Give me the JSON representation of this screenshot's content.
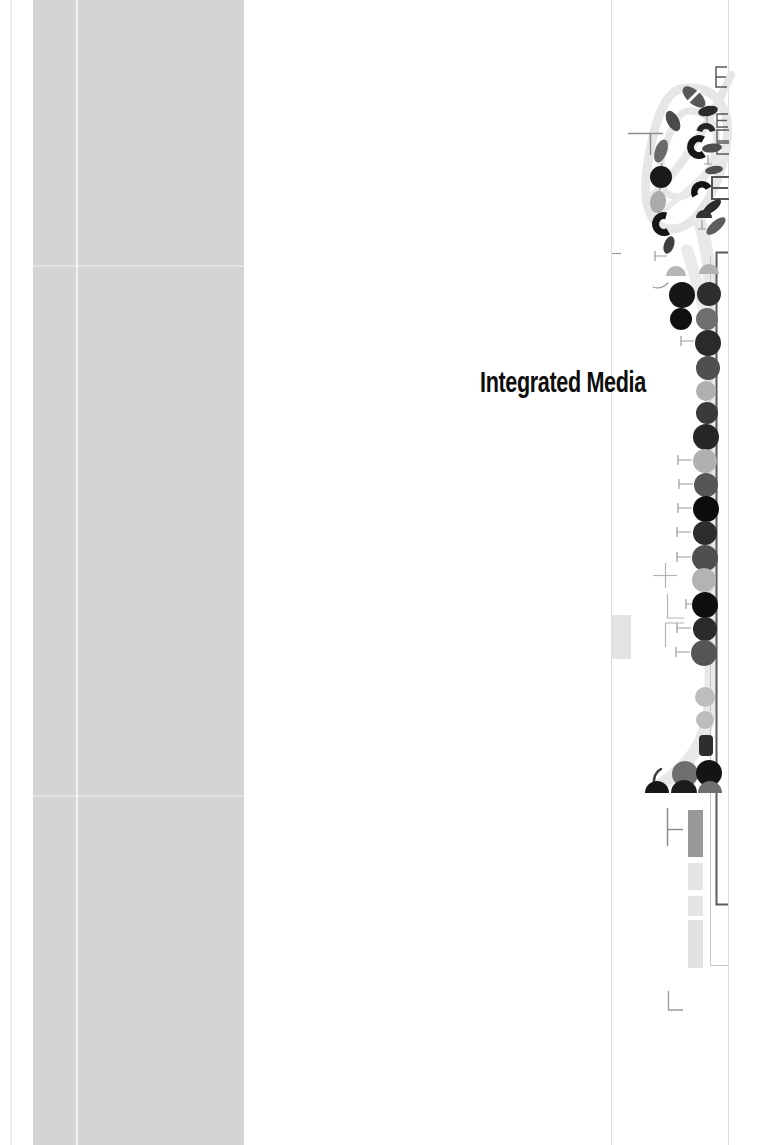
{
  "page": {
    "width": 781,
    "height": 1145,
    "background": "#ffffff",
    "title": "Integrated Media",
    "title_color": "#0e0e0e"
  },
  "artwork": {
    "palette": {
      "band_gray": "#d4d4d4",
      "swirl_gray": "#e6e6e6",
      "rule_gray": "#dedede",
      "bracket_dark": "#5b5b5b",
      "ink_black": "#141414"
    },
    "elements": [
      {
        "t": "rect",
        "name": "page-edge-line",
        "x": 10,
        "y": 0,
        "w": 2,
        "h": 1145,
        "fill": "#ededed"
      },
      {
        "t": "rect",
        "name": "left-gray-band",
        "x": 33,
        "y": 0,
        "w": 211,
        "h": 1145,
        "fill": "#d4d4d4"
      },
      {
        "t": "rect",
        "name": "band-white-line",
        "x": 76,
        "y": 0,
        "w": 2,
        "h": 1145,
        "fill": "#ffffff",
        "op": 0.7
      },
      {
        "t": "rect",
        "name": "band-artifact-line",
        "x": 33,
        "y": 265,
        "w": 211,
        "h": 2,
        "fill": "#ffffff",
        "op": 0.35
      },
      {
        "t": "rect",
        "name": "band-artifact-line",
        "x": 33,
        "y": 795,
        "w": 211,
        "h": 2,
        "fill": "#ffffff",
        "op": 0.3
      },
      {
        "t": "line",
        "name": "vertical-rule-left",
        "x1": 611.5,
        "y1": 0,
        "x2": 611.5,
        "y2": 1145,
        "c": "#dedede",
        "w": 1
      },
      {
        "t": "line",
        "name": "vertical-rule-right",
        "x1": 728.5,
        "y1": 0,
        "x2": 728.5,
        "y2": 1145,
        "c": "#dedede",
        "w": 1
      },
      {
        "t": "path",
        "name": "swirl-loop",
        "d": "M 681,89 C 714,83 731,106 727,141 C 722,183 699,226 675,229 C 651,231 642,205 647,169 C 652,131 663,92 681,89",
        "c": "#e6e6e6",
        "w": 9
      },
      {
        "t": "path",
        "name": "swirl-inner-loop",
        "d": "M 691,111 C 713,113 721,131 714,156 C 706,183 688,201 672,196 C 657,191 658,168 665,147 C 672,126 679,109 691,111",
        "c": "#e6e6e6",
        "w": 7
      },
      {
        "t": "path",
        "name": "swirl-hook",
        "d": "M 652,196 C 678,172 706,130 731,75",
        "c": "#e6e6e6",
        "w": 8
      },
      {
        "t": "path",
        "name": "swirl-diagonal",
        "d": "M 658,214 C 684,196 712,168 728,148",
        "c": "#eaeaea",
        "w": 6
      },
      {
        "t": "path",
        "name": "swirl-tail",
        "d": "M 699,220 C 712,258 711,298 711,358 L 711,688 C 711,734 695,762 659,786",
        "c": "#e8e8e8",
        "w": 13
      },
      {
        "t": "path",
        "name": "swirl-tail-upper",
        "d": "M 687,250 C 697,280 706,312 711,345",
        "c": "#ebebeb",
        "w": 12
      },
      {
        "t": "line",
        "name": "t-glyph-bar",
        "x1": 628,
        "y1": 133.5,
        "x2": 663,
        "y2": 133.5,
        "c": "#8c8c8c",
        "w": 1.5
      },
      {
        "t": "line",
        "name": "t-glyph-stem",
        "x1": 650.5,
        "y1": 133,
        "x2": 650.5,
        "y2": 155,
        "c": "#8c8c8c",
        "w": 1.5
      },
      {
        "t": "line",
        "name": "small-dash",
        "x1": 612,
        "y1": 253.5,
        "x2": 621,
        "y2": 253.5,
        "c": "#9a9a9a",
        "w": 1.2
      },
      {
        "t": "line",
        "name": "plus-glyph-h",
        "x1": 653,
        "y1": 575.5,
        "x2": 677,
        "y2": 575.5,
        "c": "#b2b2b2",
        "w": 1.2
      },
      {
        "t": "line",
        "name": "plus-glyph-v",
        "x1": 665.5,
        "y1": 563,
        "x2": 665.5,
        "y2": 588,
        "c": "#b2b2b2",
        "w": 1.2
      },
      {
        "t": "polyline",
        "name": "l-glyph",
        "pts": "667.5,594 667.5,618 684,618",
        "c": "#b2b2b2",
        "w": 1.2
      },
      {
        "t": "polyline",
        "name": "gamma-glyph",
        "pts": "684,623 665.5,623 665.5,647",
        "c": "#b2b2b2",
        "w": 1.2
      },
      {
        "t": "line",
        "name": "turnstile-glyph-v",
        "x1": 667.5,
        "y1": 808,
        "x2": 667.5,
        "y2": 846,
        "c": "#8c8c8c",
        "w": 1.5
      },
      {
        "t": "line",
        "name": "turnstile-glyph-h",
        "x1": 667,
        "y1": 829.5,
        "x2": 683,
        "y2": 829.5,
        "c": "#8c8c8c",
        "w": 1.5
      },
      {
        "t": "polyline",
        "name": "corner-glyph",
        "pts": "668.5,991 668.5,1010 683,1010",
        "c": "#9a9a9a",
        "w": 1.3
      },
      {
        "t": "polyline",
        "name": "chain-line",
        "pts": "710.5,256 710.5,965.5 728,965.5",
        "c": "#c6c6c6",
        "w": 1
      },
      {
        "t": "polyline",
        "name": "dark-bracket-line",
        "pts": "728,252.5 716.5,252.5 716.5,904.5 728,904.5",
        "c": "#5b5b5b",
        "w": 2
      },
      {
        "t": "rect",
        "name": "light-gray-block",
        "x": 612,
        "y": 615,
        "w": 19,
        "h": 44,
        "fill": "#e3e3e3"
      },
      {
        "t": "rect",
        "name": "medium-gray-bar",
        "x": 688,
        "y": 810,
        "w": 15,
        "h": 47,
        "fill": "#989898"
      },
      {
        "t": "rect",
        "name": "light-bar",
        "x": 688,
        "y": 863,
        "w": 15,
        "h": 27,
        "fill": "#e4e4e4"
      },
      {
        "t": "rect",
        "name": "light-bar",
        "x": 688,
        "y": 896,
        "w": 15,
        "h": 20,
        "fill": "#e4e4e4"
      },
      {
        "t": "rect",
        "name": "light-bar",
        "x": 688,
        "y": 920,
        "w": 15,
        "h": 48,
        "fill": "#e2e2e2"
      },
      {
        "t": "eglyph",
        "name": "e-bracket-glyph",
        "x": 716,
        "y": 67,
        "w": 11,
        "h": 20,
        "arms": 3,
        "c": "#5a5a5a",
        "sw": 1.5
      },
      {
        "t": "eglyph",
        "name": "e-bracket-glyph",
        "x": 717,
        "y": 114,
        "w": 11,
        "h": 13,
        "arms": 3,
        "c": "#5a5a5a",
        "sw": 1.4
      },
      {
        "t": "eglyph",
        "name": "square-bracket-glyph",
        "x": 717,
        "y": 130,
        "w": 12,
        "h": 11,
        "arms": 2,
        "c": "#5a5a5a",
        "sw": 1.4
      },
      {
        "t": "eglyph",
        "name": "square-bracket-glyph",
        "x": 717,
        "y": 143,
        "w": 12,
        "h": 11,
        "arms": 2,
        "c": "#5a5a5a",
        "sw": 1.4
      },
      {
        "t": "eglyph",
        "name": "e-bracket-glyph",
        "x": 712,
        "y": 177,
        "w": 17,
        "h": 22,
        "arms": 3,
        "c": "#555555",
        "sw": 2
      },
      {
        "t": "ellipse",
        "name": "petal",
        "cx": 694,
        "cy": 97,
        "rx": 7,
        "ry": 14,
        "rot": -48,
        "fill": "#585858"
      },
      {
        "t": "line",
        "name": "petal-slash",
        "x1": 686,
        "y1": 104,
        "x2": 700,
        "y2": 90,
        "c": "#ffffff",
        "w": 3
      },
      {
        "t": "ellipse",
        "name": "petal",
        "cx": 673,
        "cy": 121,
        "rx": 6,
        "ry": 11,
        "rot": -28,
        "fill": "#4a4a4a"
      },
      {
        "t": "ellipse",
        "name": "petal",
        "cx": 708,
        "cy": 111,
        "rx": 10,
        "ry": 5,
        "rot": -12,
        "fill": "#2b2b2b"
      },
      {
        "t": "tstem",
        "name": "stem-glyph",
        "x": 707,
        "y": 116,
        "len": 10
      },
      {
        "t": "arcband",
        "name": "crescent",
        "cx": 706,
        "cy": 133,
        "ro": 10,
        "ri": 4,
        "a0": 195,
        "a1": 345,
        "fill": "#262626"
      },
      {
        "t": "ellipse",
        "name": "petal",
        "cx": 661,
        "cy": 151,
        "rx": 6,
        "ry": 12,
        "rot": 20,
        "fill": "#6a6a6a"
      },
      {
        "t": "arcband",
        "name": "crescent",
        "cx": 699,
        "cy": 147,
        "ro": 12,
        "ri": 5,
        "a0": 55,
        "a1": 300,
        "fill": "#161616"
      },
      {
        "t": "ellipse",
        "name": "petal",
        "cx": 712,
        "cy": 148,
        "rx": 10,
        "ry": 4.5,
        "rot": -6,
        "fill": "#4f4f4f"
      },
      {
        "t": "line",
        "name": "chain-link",
        "x1": 662,
        "y1": 163,
        "x2": 661,
        "y2": 167,
        "c": "#8a8a8a",
        "w": 1
      },
      {
        "t": "circle",
        "name": "blob",
        "cx": 661,
        "cy": 177,
        "r": 11,
        "fill": "#1a1a1a"
      },
      {
        "t": "tstem",
        "name": "stem-glyph",
        "x": 708,
        "y": 155,
        "len": 9
      },
      {
        "t": "ellipse",
        "name": "petal",
        "cx": 714,
        "cy": 170,
        "rx": 9,
        "ry": 4,
        "rot": -10,
        "fill": "#505050"
      },
      {
        "t": "line",
        "name": "chain-link",
        "x1": 660,
        "y1": 188,
        "x2": 659,
        "y2": 192,
        "c": "#8a8a8a",
        "w": 1
      },
      {
        "t": "ellipse",
        "name": "petal",
        "cx": 658,
        "cy": 202,
        "rx": 8,
        "ry": 11,
        "rot": 8,
        "fill": "#ababab"
      },
      {
        "t": "arcband",
        "name": "crescent",
        "cx": 702,
        "cy": 192,
        "ro": 11,
        "ri": 4.5,
        "a0": 150,
        "a1": 330,
        "fill": "#121212"
      },
      {
        "t": "line",
        "name": "chain-link",
        "x1": 659,
        "y1": 213,
        "x2": 661,
        "y2": 215,
        "c": "#8a8a8a",
        "w": 1
      },
      {
        "t": "arcband",
        "name": "crescent",
        "cx": 664,
        "cy": 224,
        "ro": 12,
        "ri": 5,
        "a0": 60,
        "a1": 285,
        "fill": "#161616"
      },
      {
        "t": "ellipse",
        "name": "petal",
        "cx": 712,
        "cy": 207,
        "rx": 11,
        "ry": 4.5,
        "rot": -38,
        "fill": "#2c2c2c"
      },
      {
        "t": "dome",
        "name": "half-dome",
        "cx": 704,
        "cy": 218,
        "r": 8,
        "fill": "#333333"
      },
      {
        "t": "tstem",
        "name": "stem-glyph",
        "x": 702,
        "y": 220,
        "len": 9
      },
      {
        "t": "ellipse",
        "name": "petal",
        "cx": 716,
        "cy": 226,
        "rx": 12,
        "ry": 5,
        "rot": -42,
        "fill": "#5d5d5d"
      },
      {
        "t": "ellipse",
        "name": "petal",
        "cx": 669,
        "cy": 245,
        "rx": 5,
        "ry": 9,
        "rot": 20,
        "fill": "#3f3f3f"
      },
      {
        "t": "stem",
        "name": "stem-glyph",
        "x": 655,
        "y": 256,
        "len": 12
      },
      {
        "t": "path",
        "name": "curved-stem",
        "d": "M 668,283 C 663,288 658,289 653,287",
        "c": "#999999",
        "w": 1.2
      },
      {
        "t": "dome",
        "name": "half-dome",
        "cx": 676,
        "cy": 276,
        "r": 10,
        "fill": "#b5b5b5"
      },
      {
        "t": "dome",
        "name": "half-dome",
        "cx": 709,
        "cy": 274,
        "r": 10,
        "fill": "#b2b2b2"
      },
      {
        "t": "circle",
        "name": "chain-circle",
        "cx": 682,
        "cy": 295,
        "r": 13,
        "fill": "#161616"
      },
      {
        "t": "circle",
        "name": "chain-circle",
        "cx": 709,
        "cy": 294,
        "r": 12,
        "fill": "#2e2e2e"
      },
      {
        "t": "circle",
        "name": "chain-circle",
        "cx": 681,
        "cy": 319,
        "r": 11,
        "fill": "#101010"
      },
      {
        "t": "circle",
        "name": "chain-circle",
        "cx": 707,
        "cy": 319,
        "r": 11,
        "fill": "#6f6f6f"
      },
      {
        "t": "stem",
        "name": "stem-glyph",
        "x": 681,
        "y": 341,
        "len": 13
      },
      {
        "t": "circle",
        "name": "chain-circle",
        "cx": 708,
        "cy": 343,
        "r": 13,
        "fill": "#2a2a2a"
      },
      {
        "t": "circle",
        "name": "chain-circle",
        "cx": 708,
        "cy": 368,
        "r": 12,
        "fill": "#4f4f4f"
      },
      {
        "t": "circle",
        "name": "chain-circle",
        "cx": 706,
        "cy": 391,
        "r": 10,
        "fill": "#b0b0b0"
      },
      {
        "t": "circle",
        "name": "chain-circle",
        "cx": 707,
        "cy": 413,
        "r": 11,
        "fill": "#3a3a3a"
      },
      {
        "t": "circle",
        "name": "chain-circle",
        "cx": 706,
        "cy": 437,
        "r": 13,
        "fill": "#262626"
      },
      {
        "t": "stem",
        "name": "stem-glyph",
        "x": 678,
        "y": 460,
        "len": 14
      },
      {
        "t": "circle",
        "name": "chain-circle",
        "cx": 705,
        "cy": 461,
        "r": 12,
        "fill": "#b0b0b0"
      },
      {
        "t": "stem",
        "name": "stem-glyph",
        "x": 679,
        "y": 484,
        "len": 14
      },
      {
        "t": "circle",
        "name": "chain-circle",
        "cx": 706,
        "cy": 485,
        "r": 12,
        "fill": "#565656"
      },
      {
        "t": "stem",
        "name": "stem-glyph",
        "x": 678,
        "y": 508,
        "len": 14
      },
      {
        "t": "circle",
        "name": "chain-circle",
        "cx": 706,
        "cy": 509,
        "r": 13,
        "fill": "#0c0c0c"
      },
      {
        "t": "stem",
        "name": "stem-glyph",
        "x": 677,
        "y": 532,
        "len": 14
      },
      {
        "t": "circle",
        "name": "chain-circle",
        "cx": 705,
        "cy": 533,
        "r": 12,
        "fill": "#2d2d2d"
      },
      {
        "t": "stem",
        "name": "stem-glyph",
        "x": 677,
        "y": 557,
        "len": 14
      },
      {
        "t": "circle",
        "name": "chain-circle",
        "cx": 705,
        "cy": 558,
        "r": 13,
        "fill": "#4f4f4f"
      },
      {
        "t": "circle",
        "name": "chain-circle",
        "cx": 704,
        "cy": 580,
        "r": 12,
        "fill": "#b3b3b3"
      },
      {
        "t": "stem",
        "name": "stem-glyph",
        "x": 686,
        "y": 604,
        "len": 6
      },
      {
        "t": "circle",
        "name": "chain-circle",
        "cx": 705,
        "cy": 605,
        "r": 13,
        "fill": "#0f0f0f"
      },
      {
        "t": "stem",
        "name": "stem-glyph",
        "x": 677,
        "y": 628,
        "len": 14
      },
      {
        "t": "circle",
        "name": "chain-circle",
        "cx": 705,
        "cy": 629,
        "r": 12,
        "fill": "#2b2b2b"
      },
      {
        "t": "stem",
        "name": "stem-glyph",
        "x": 676,
        "y": 652,
        "len": 14
      },
      {
        "t": "circle",
        "name": "chain-circle",
        "cx": 704,
        "cy": 653,
        "r": 13,
        "fill": "#555555"
      },
      {
        "t": "circle",
        "name": "chain-circle",
        "cx": 705,
        "cy": 697,
        "r": 10,
        "fill": "#bdbdbd"
      },
      {
        "t": "circle",
        "name": "chain-circle",
        "cx": 705,
        "cy": 720,
        "r": 9,
        "fill": "#bdbdbd"
      },
      {
        "t": "rect",
        "name": "chain-block",
        "x": 699,
        "y": 735,
        "w": 14,
        "h": 21,
        "rx": 4,
        "fill": "#2e2e2e"
      },
      {
        "t": "circle",
        "name": "chain-circle",
        "cx": 685,
        "cy": 774,
        "r": 13,
        "fill": "#6f6f6f"
      },
      {
        "t": "circle",
        "name": "chain-circle",
        "cx": 709,
        "cy": 773,
        "r": 13,
        "fill": "#141414"
      },
      {
        "t": "path",
        "name": "curved-stem",
        "d": "M 656,789 C 652,782 654,773 661,769",
        "c": "#3a3a3a",
        "w": 2.5
      },
      {
        "t": "dome",
        "name": "half-dome",
        "cx": 657,
        "cy": 793,
        "r": 12,
        "fill": "#161616"
      },
      {
        "t": "dome",
        "name": "half-dome",
        "cx": 684,
        "cy": 793,
        "r": 13,
        "fill": "#1c1c1c"
      },
      {
        "t": "dome",
        "name": "half-dome",
        "cx": 710,
        "cy": 793,
        "r": 12,
        "fill": "#6f6f6f"
      }
    ]
  }
}
